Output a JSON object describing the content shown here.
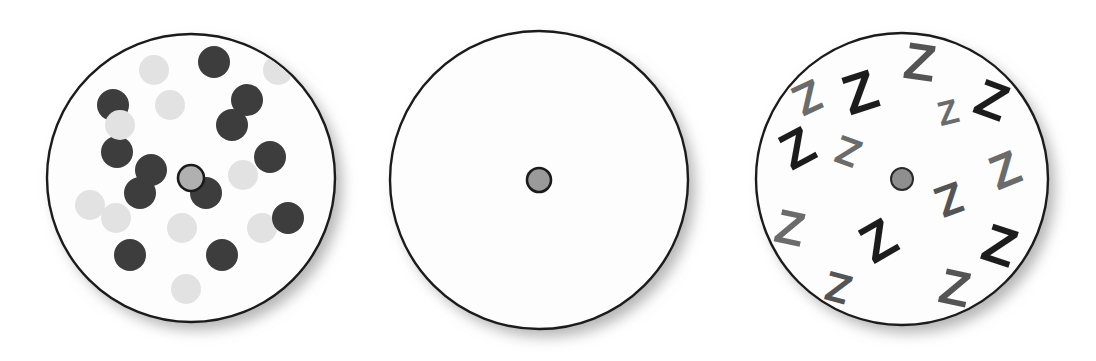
{
  "figure": {
    "background_color": "#ffffff",
    "width": 1096,
    "height": 361,
    "outline_color": "#1b1b1b",
    "shadow_color": "#b9b9b9"
  },
  "palette": {
    "disc_face": "#fdfdfd",
    "dot_dark": "#3d3d3d",
    "dot_light": "#e2e2e2",
    "hub_fill_light": "#b0b0b0",
    "hub_fill_mid": "#9a9a9a",
    "hub_fill_gray": "#8f8f8f",
    "wedge_darkest": "#5a5a5a",
    "wedge_dark": "#6e6e6e",
    "wedge_mid": "#8e8e8e",
    "wedge_light": "#b4b4b4",
    "wedge_lighter": "#cfcfcf",
    "wedge_lightest": "#ededed",
    "z_black": "#1c1c1c",
    "z_gray": "#6b6b6b",
    "z_midgray": "#545454"
  },
  "discs": [
    {
      "name": "dot-disc",
      "label": "Disc 1 - scattered dots",
      "cx": 191,
      "cy": 178,
      "r": 144,
      "hub": {
        "r": 13,
        "fill": "#b0b0b0",
        "ring": true
      }
    },
    {
      "name": "wedge-disc",
      "label": "Disc 2 - pie wedges",
      "cx": 539,
      "cy": 180,
      "r": 149,
      "hub": {
        "r": 12,
        "fill": "#9a9a9a",
        "ring": true
      }
    },
    {
      "name": "letter-disc",
      "label": "Disc 3 - scattered Z letters",
      "cx": 902,
      "cy": 179,
      "r": 146,
      "hub": {
        "r": 11,
        "fill": "#8f8f8f",
        "ring": false
      }
    }
  ],
  "dots": [
    {
      "cx": 154,
      "cy": 70,
      "r": 15,
      "shade": "light"
    },
    {
      "cx": 214,
      "cy": 62,
      "r": 16,
      "shade": "dark"
    },
    {
      "cx": 278,
      "cy": 70,
      "r": 15,
      "shade": "light"
    },
    {
      "cx": 113,
      "cy": 105,
      "r": 16,
      "shade": "dark"
    },
    {
      "cx": 170,
      "cy": 105,
      "r": 15,
      "shade": "light"
    },
    {
      "cx": 247,
      "cy": 100,
      "r": 16,
      "shade": "dark"
    },
    {
      "cx": 117,
      "cy": 152,
      "r": 16,
      "shade": "dark"
    },
    {
      "cx": 120,
      "cy": 125,
      "r": 15,
      "shade": "light"
    },
    {
      "cx": 232,
      "cy": 125,
      "r": 16,
      "shade": "dark"
    },
    {
      "cx": 270,
      "cy": 157,
      "r": 16,
      "shade": "dark"
    },
    {
      "cx": 151,
      "cy": 170,
      "r": 16,
      "shade": "dark"
    },
    {
      "cx": 140,
      "cy": 193,
      "r": 16,
      "shade": "dark"
    },
    {
      "cx": 206,
      "cy": 193,
      "r": 16,
      "shade": "dark"
    },
    {
      "cx": 243,
      "cy": 175,
      "r": 15,
      "shade": "light"
    },
    {
      "cx": 90,
      "cy": 205,
      "r": 15,
      "shade": "light"
    },
    {
      "cx": 130,
      "cy": 255,
      "r": 16,
      "shade": "dark"
    },
    {
      "cx": 182,
      "cy": 228,
      "r": 15,
      "shade": "light"
    },
    {
      "cx": 222,
      "cy": 255,
      "r": 16,
      "shade": "dark"
    },
    {
      "cx": 262,
      "cy": 228,
      "r": 15,
      "shade": "light"
    },
    {
      "cx": 288,
      "cy": 218,
      "r": 16,
      "shade": "dark"
    },
    {
      "cx": 186,
      "cy": 289,
      "r": 15,
      "shade": "light"
    },
    {
      "cx": 116,
      "cy": 218,
      "r": 15,
      "shade": "light"
    }
  ],
  "wedges": [
    {
      "start": -90,
      "end": -60,
      "shade": "#8e8e8e"
    },
    {
      "start": -60,
      "end": -30,
      "shade": "#b4b4b4"
    },
    {
      "start": -30,
      "end": 0,
      "shade": "#5a5a5a"
    },
    {
      "start": 0,
      "end": 30,
      "shade": "#6e6e6e"
    },
    {
      "start": 30,
      "end": 60,
      "shade": "#8e8e8e"
    },
    {
      "start": 60,
      "end": 90,
      "shade": "#ededed"
    },
    {
      "start": 90,
      "end": 120,
      "shade": "#b4b4b4"
    },
    {
      "start": 120,
      "end": 150,
      "shade": "#cfcfcf"
    },
    {
      "start": 150,
      "end": 180,
      "shade": "#5a5a5a"
    },
    {
      "start": 180,
      "end": 210,
      "shade": "#6e6e6e"
    },
    {
      "start": 210,
      "end": 240,
      "shade": "#ededed"
    },
    {
      "start": 240,
      "end": 270,
      "shade": "#8e8e8e"
    }
  ],
  "letters": [
    {
      "char": "Z",
      "x": 920,
      "y": 62,
      "size": 52,
      "rot": 8,
      "shade": "#545454"
    },
    {
      "char": "Z",
      "x": 860,
      "y": 92,
      "size": 56,
      "rot": -18,
      "shade": "#1c1c1c"
    },
    {
      "char": "Z",
      "x": 808,
      "y": 98,
      "size": 44,
      "rot": 155,
      "shade": "#6b6b6b"
    },
    {
      "char": "Z",
      "x": 948,
      "y": 112,
      "size": 34,
      "rot": -14,
      "shade": "#6b6b6b"
    },
    {
      "char": "Z",
      "x": 992,
      "y": 100,
      "size": 52,
      "rot": 20,
      "shade": "#1c1c1c"
    },
    {
      "char": "Z",
      "x": 797,
      "y": 148,
      "size": 52,
      "rot": -28,
      "shade": "#1c1c1c"
    },
    {
      "char": "Z",
      "x": 848,
      "y": 152,
      "size": 40,
      "rot": 200,
      "shade": "#6b6b6b"
    },
    {
      "char": "Z",
      "x": 1005,
      "y": 170,
      "size": 48,
      "rot": -22,
      "shade": "#6b6b6b"
    },
    {
      "char": "Z",
      "x": 950,
      "y": 200,
      "size": 44,
      "rot": 160,
      "shade": "#545454"
    },
    {
      "char": "Z",
      "x": 790,
      "y": 228,
      "size": 48,
      "rot": 12,
      "shade": "#6b6b6b"
    },
    {
      "char": "Z",
      "x": 878,
      "y": 240,
      "size": 54,
      "rot": -30,
      "shade": "#1c1c1c"
    },
    {
      "char": "Z",
      "x": 1000,
      "y": 245,
      "size": 54,
      "rot": 18,
      "shade": "#1c1c1c"
    },
    {
      "char": "Z",
      "x": 838,
      "y": 288,
      "size": 42,
      "rot": 195,
      "shade": "#545454"
    },
    {
      "char": "Z",
      "x": 955,
      "y": 288,
      "size": 50,
      "rot": 12,
      "shade": "#545454"
    }
  ]
}
